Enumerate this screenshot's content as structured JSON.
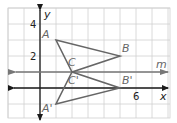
{
  "diagram": {
    "type": "coordinate-plane-reflection",
    "grid": {
      "x_min": -2,
      "x_max": 8,
      "y_min": -2,
      "y_max": 5,
      "cell_px": 16,
      "origin_px": [
        40,
        88
      ],
      "line_color": "#d0d0d0"
    },
    "axes": {
      "x_label": "x",
      "y_label": "y",
      "x_tick_labels": [
        {
          "value": 6,
          "text": "6"
        }
      ],
      "y_tick_labels": [
        {
          "value": 4,
          "text": "4"
        },
        {
          "value": 2,
          "text": "2"
        }
      ],
      "color": "#1a1a1a"
    },
    "line_m": {
      "label": "m",
      "y": 1,
      "color": "#777777"
    },
    "triangle_original": {
      "color": "#666666",
      "vertices": [
        {
          "name": "A",
          "label": "A",
          "x": 1,
          "y": 3
        },
        {
          "name": "B",
          "label": "B",
          "x": 5,
          "y": 2
        },
        {
          "name": "C",
          "label": "C",
          "x": 2,
          "y": 1
        }
      ]
    },
    "triangle_image": {
      "color": "#666666",
      "vertices": [
        {
          "name": "A'",
          "label": "A'",
          "x": 1,
          "y": -1
        },
        {
          "name": "B'",
          "label": "B'",
          "x": 5,
          "y": 0
        },
        {
          "name": "C'",
          "label": "C'",
          "x": 2,
          "y": 1
        }
      ]
    }
  }
}
